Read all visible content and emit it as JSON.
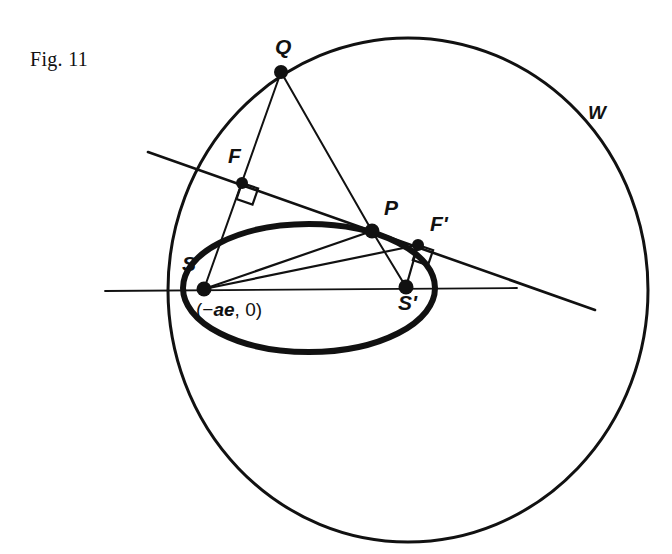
{
  "figure": {
    "caption": "Fig. 11",
    "stroke_color": "#111111",
    "background_color": "#ffffff"
  },
  "chart_data": {
    "type": "diagram",
    "title": "Fig. 11",
    "curves": [
      {
        "name": "W",
        "label": "W",
        "kind": "circle",
        "cx": 408,
        "cy": 290,
        "rx": 240,
        "ry": 252,
        "stroke_width": 3.0
      },
      {
        "name": "ellipse",
        "label": "",
        "kind": "ellipse",
        "cx": 309,
        "cy": 288,
        "rx": 126,
        "ry": 64,
        "stroke_width": 6.0
      }
    ],
    "points": [
      {
        "name": "Q",
        "label": "Q",
        "x": 281,
        "y": 72,
        "label_dx": -6,
        "label_dy": -30,
        "dot_r": 7.0
      },
      {
        "name": "F",
        "label": "F",
        "x": 242,
        "y": 183,
        "label_dx": -14,
        "label_dy": -32,
        "dot_r": 6.0
      },
      {
        "name": "P",
        "label": "P",
        "x": 372,
        "y": 231,
        "label_dx": 12,
        "label_dy": -28,
        "dot_r": 7.5
      },
      {
        "name": "F'",
        "label": "F'",
        "x": 418,
        "y": 245,
        "label_dx": 12,
        "label_dy": -26,
        "dot_r": 6.0
      },
      {
        "name": "S",
        "label": "S",
        "x": 204,
        "y": 289,
        "label_dx": -22,
        "label_dy": -30,
        "dot_r": 7.5
      },
      {
        "name": "S'",
        "label": "S'",
        "x": 406,
        "y": 287,
        "label_dx": -8,
        "label_dy": 12,
        "dot_r": 7.5
      }
    ],
    "annotations": [
      {
        "name": "focus-coordinate",
        "text_prefix": "(−",
        "text_italic": "ae",
        "text_suffix": ", 0)",
        "x": 196,
        "y": 300
      },
      {
        "name": "circle-name",
        "text": "W",
        "x": 588,
        "y": 103
      }
    ],
    "segments": [
      {
        "name": "Q-to-S",
        "from": "Q",
        "to": "S",
        "width": 2.0
      },
      {
        "name": "Q-to-P",
        "from": "Q",
        "to": "P",
        "width": 2.0
      },
      {
        "name": "S-to-P",
        "from": "S",
        "to": "P",
        "width": 2.2
      },
      {
        "name": "S-to-F'",
        "from": "S",
        "to": "F'",
        "width": 2.2
      },
      {
        "name": "P-to-S'",
        "from": "P",
        "to": "S'",
        "width": 2.0
      },
      {
        "name": "S'-to-F'",
        "from": "S'",
        "to": "F'",
        "width": 2.2
      }
    ],
    "lines": [
      {
        "name": "tangent-at-P",
        "x1": 148,
        "y1": 152,
        "x2": 595,
        "y2": 310,
        "width": 2.6
      },
      {
        "name": "major-axis",
        "x1": 105,
        "y1": 291,
        "x2": 517,
        "y2": 288,
        "width": 1.8
      }
    ],
    "right_angles": [
      {
        "name": "right-angle-at-F",
        "vertex_x": 242,
        "vertex_y": 183,
        "size": 17,
        "rotation": 19
      },
      {
        "name": "right-angle-at-F2",
        "vertex_x": 418,
        "vertex_y": 245,
        "size": 16,
        "rotation": 19
      }
    ]
  }
}
